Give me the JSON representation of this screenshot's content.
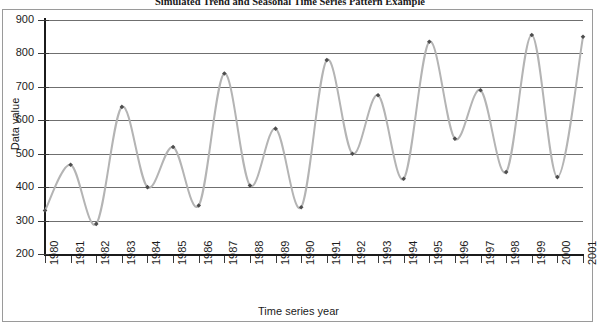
{
  "chart_data": {
    "type": "line",
    "title": "Simulated Trend and Seasonal Time Series Pattern Example",
    "xlabel": "Time series year",
    "ylabel": "Data value",
    "grid": true,
    "legend": "none",
    "xlim": [
      1980,
      2001
    ],
    "ylim": [
      200,
      900
    ],
    "y_ticks": [
      900,
      800,
      700,
      600,
      500,
      400,
      300,
      200
    ],
    "categories": [
      "1980",
      "1981",
      "1982",
      "1983",
      "1984",
      "1985",
      "1986",
      "1987",
      "1988",
      "1989",
      "1990",
      "1991",
      "1992",
      "1993",
      "1994",
      "1995",
      "1996",
      "1997",
      "1998",
      "1999",
      "2000",
      "2001"
    ],
    "x": [
      1980,
      1981,
      1982,
      1983,
      1984,
      1985,
      1986,
      1987,
      1988,
      1989,
      1990,
      1991,
      1992,
      1993,
      1994,
      1995,
      1996,
      1997,
      1998,
      1999,
      2000,
      2001
    ],
    "values": [
      330,
      467,
      290,
      640,
      400,
      520,
      345,
      740,
      405,
      575,
      340,
      780,
      500,
      675,
      425,
      835,
      545,
      690,
      445,
      855,
      430,
      850
    ],
    "series": [
      {
        "name": "Data value",
        "color": "#b4b4b4",
        "marker": "diamond",
        "marker_color": "#4d4d4d",
        "values": [
          330,
          467,
          290,
          640,
          400,
          520,
          345,
          740,
          405,
          575,
          340,
          780,
          500,
          675,
          425,
          835,
          545,
          690,
          445,
          855,
          430,
          850
        ]
      }
    ]
  },
  "axes": {
    "y_title": "Data value",
    "x_title": "Time series year",
    "y_tick_labels": [
      "900",
      "800",
      "700",
      "600",
      "500",
      "400",
      "300",
      "200"
    ],
    "x_tick_labels": [
      "1980",
      "1981",
      "1982",
      "1983",
      "1984",
      "1985",
      "1986",
      "1987",
      "1988",
      "1989",
      "1990",
      "1991",
      "1992",
      "1993",
      "1994",
      "1995",
      "1996",
      "1997",
      "1998",
      "1999",
      "2000",
      "2001"
    ]
  },
  "colors": {
    "line": "#b4b4b4",
    "marker": "#4d4d4d",
    "grid": "#6f6f6f",
    "axis": "#1b1b1b",
    "frame": "#9a9a9a",
    "background": "#ffffff"
  }
}
